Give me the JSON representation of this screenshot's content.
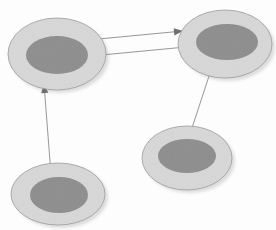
{
  "canvas": {
    "width": 276,
    "height": 230,
    "background": "#fdfdfd",
    "title": "Ellipse Node Diagram"
  },
  "palette": {
    "outer_fill": "#d8d8d8",
    "outer_stroke": "#9a9a9a",
    "inner_fill": "#8d8d8d",
    "shadow": "#bdbdbd",
    "edge_stroke": "#8b8b8b",
    "edge_head": "#6f6f6f",
    "background": "#fdfdfd"
  },
  "nodes": [
    {
      "id": "node-top-left",
      "name": "top-left",
      "label": "",
      "outer": {
        "cx": 57,
        "cy": 54,
        "rx": 49,
        "ry": 36
      },
      "inner": {
        "cx": 57,
        "cy": 55,
        "rx": 31,
        "ry": 19
      },
      "shadow": {
        "cx": 60,
        "cy": 57,
        "rx": 49,
        "ry": 36
      }
    },
    {
      "id": "node-top-right",
      "name": "top-right",
      "label": "",
      "outer": {
        "cx": 225,
        "cy": 44,
        "rx": 47,
        "ry": 34
      },
      "inner": {
        "cx": 227,
        "cy": 42,
        "rx": 31,
        "ry": 18
      },
      "shadow": {
        "cx": 228,
        "cy": 47,
        "rx": 47,
        "ry": 34
      }
    },
    {
      "id": "node-bottom-left",
      "name": "bottom-left",
      "label": "",
      "outer": {
        "cx": 58,
        "cy": 194,
        "rx": 47,
        "ry": 31
      },
      "inner": {
        "cx": 59,
        "cy": 195,
        "rx": 29,
        "ry": 18
      },
      "shadow": {
        "cx": 61,
        "cy": 197,
        "rx": 47,
        "ry": 31
      }
    },
    {
      "id": "node-bottom-right",
      "name": "bottom-right",
      "label": "",
      "outer": {
        "cx": 187,
        "cy": 158,
        "rx": 45,
        "ry": 32
      },
      "inner": {
        "cx": 187,
        "cy": 156,
        "rx": 29,
        "ry": 17
      },
      "shadow": {
        "cx": 190,
        "cy": 161,
        "rx": 45,
        "ry": 32
      }
    }
  ],
  "edges": [
    {
      "id": "edge-left-to-right",
      "name": "top-left-to-top-right",
      "from": "node-top-left",
      "to": "node-top-right",
      "direction": "right",
      "x1": 88,
      "y1": 40,
      "x2": 183,
      "y2": 31,
      "head_at": {
        "x": 183,
        "y": 31
      },
      "head_angle": -5
    },
    {
      "id": "edge-right-to-left",
      "name": "top-right-to-top-left",
      "from": "node-top-right",
      "to": "node-top-left",
      "direction": "left",
      "x1": 186,
      "y1": 47,
      "x2": 91,
      "y2": 56,
      "head_at": {
        "x": 91,
        "y": 56
      },
      "head_angle": 175
    },
    {
      "id": "edge-bottomleft-to-topleft",
      "name": "bottom-left-to-top-left",
      "from": "node-bottom-left",
      "to": "node-top-left",
      "direction": "up",
      "x1": 51,
      "y1": 174,
      "x2": 44,
      "y2": 84,
      "head_at": {
        "x": 44,
        "y": 84
      },
      "head_angle": -94
    },
    {
      "id": "edge-bottomright-to-topright",
      "name": "bottom-right-to-top-right",
      "from": "node-bottom-right",
      "to": "node-top-right",
      "direction": "up-right",
      "x1": 191,
      "y1": 131,
      "x2": 212,
      "y2": 67,
      "head_at": {
        "x": 212,
        "y": 67
      },
      "head_angle": -72
    }
  ]
}
